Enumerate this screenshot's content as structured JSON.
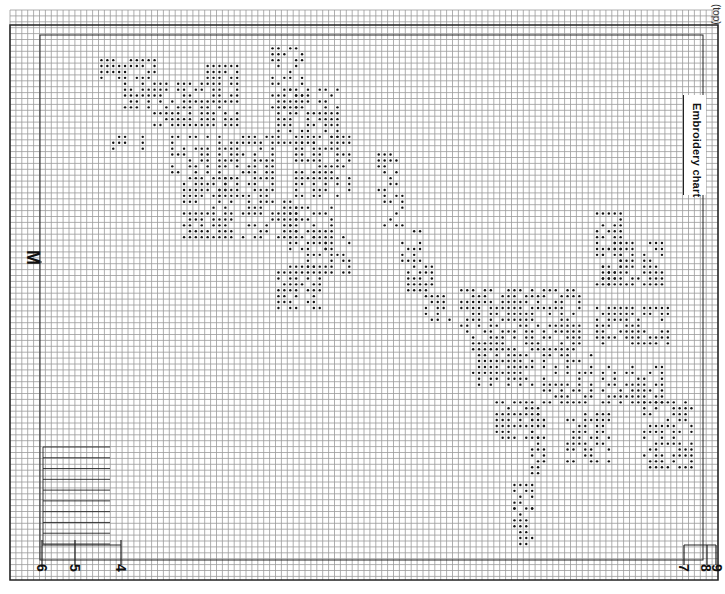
{
  "title": "Embroidery chart",
  "orientation_note": "(top)",
  "center_mark": "M",
  "grid": {
    "left": 10,
    "top": 10,
    "right": 718,
    "bottom": 580,
    "cell": 5.9,
    "line_color": "#9a9a9a",
    "major_color": "#222222",
    "stitch_color": "#111111"
  },
  "markers": {
    "bottom_numbers": [
      {
        "label": "6",
        "x": 42
      },
      {
        "label": "5",
        "x": 75
      },
      {
        "label": "4",
        "x": 121
      }
    ],
    "right_numbers": [
      {
        "label": "7",
        "x": 684
      },
      {
        "label": "8",
        "x": 707
      },
      {
        "label": "9",
        "x": 716
      }
    ]
  },
  "legend_block": {
    "x": 43,
    "y": 447,
    "w": 67,
    "h": 97,
    "lines": 9
  },
  "motifs": [
    {
      "name": "upper-left-flower",
      "region": [
        95,
        50,
        360,
        310
      ]
    },
    {
      "name": "diagonal-stem",
      "region": [
        370,
        150,
        450,
        320
      ]
    },
    {
      "name": "right-flower-cluster",
      "region": [
        450,
        205,
        690,
        480
      ]
    },
    {
      "name": "lower-stem",
      "region": [
        510,
        480,
        540,
        545
      ]
    }
  ],
  "chart_data": {
    "type": "table",
    "title": "Embroidery chart",
    "xlabel": "",
    "ylabel": "",
    "grid": true,
    "annotations": [
      "M",
      "(top)",
      "4",
      "5",
      "6",
      "7",
      "8",
      "9"
    ]
  }
}
